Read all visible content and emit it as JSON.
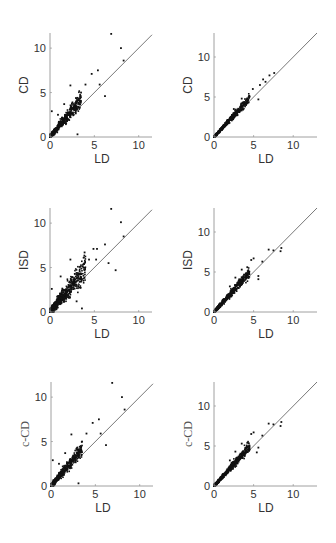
{
  "chart_data": [
    {
      "id": "p11",
      "type": "scatter",
      "row": 0,
      "col": 0,
      "xlabel": "LD",
      "ylabel": "CD",
      "ylabel_style": "sans",
      "xlim": [
        0,
        11.5
      ],
      "ylim": [
        0,
        11.7
      ],
      "xticks": [
        0,
        5,
        10
      ],
      "yticks": [
        0,
        5,
        10
      ],
      "reference_line": "y = x",
      "grid": false,
      "legend": null,
      "cluster": {
        "n": 650,
        "spread": 0.35,
        "bias": 0.2,
        "xmax": 3.5,
        "seed": 11
      },
      "points": [
        [
          6.9,
          11.6
        ],
        [
          8.0,
          10.0
        ],
        [
          8.3,
          8.6
        ],
        [
          6.2,
          4.6
        ],
        [
          5.4,
          7.5
        ],
        [
          4.7,
          7.1
        ],
        [
          2.3,
          5.8
        ],
        [
          3.1,
          0.3
        ],
        [
          0.2,
          2.9
        ],
        [
          4.0,
          5.9
        ],
        [
          5.6,
          5.9
        ],
        [
          3.5,
          5.0
        ],
        [
          0.9,
          2.5
        ],
        [
          1.6,
          3.7
        ]
      ]
    },
    {
      "id": "p12",
      "type": "scatter",
      "row": 0,
      "col": 1,
      "xlabel": "LD",
      "ylabel": "CD",
      "ylabel_style": "sans",
      "xlim": [
        0,
        13
      ],
      "ylim": [
        0,
        13
      ],
      "xticks": [
        0,
        5,
        10
      ],
      "yticks": [
        0,
        5,
        10
      ],
      "reference_line": "y = x",
      "grid": false,
      "legend": null,
      "cluster": {
        "n": 600,
        "spread": 0.18,
        "bias": 0.08,
        "xmax": 4.5,
        "seed": 12
      },
      "points": [
        [
          7.6,
          8.0
        ],
        [
          7.0,
          7.7
        ],
        [
          6.2,
          7.2
        ],
        [
          5.8,
          6.5
        ],
        [
          5.6,
          4.7
        ],
        [
          4.9,
          6.0
        ],
        [
          4.3,
          4.6
        ],
        [
          3.5,
          4.8
        ],
        [
          2.5,
          3.5
        ],
        [
          6.5,
          6.9
        ]
      ]
    },
    {
      "id": "p21",
      "type": "scatter",
      "row": 1,
      "col": 0,
      "xlabel": "LD",
      "ylabel": "ISD",
      "ylabel_style": "sans",
      "xlim": [
        0,
        11.5
      ],
      "ylim": [
        0,
        11.7
      ],
      "xticks": [
        0,
        5,
        10
      ],
      "yticks": [
        0,
        5,
        10
      ],
      "reference_line": "y = x",
      "grid": false,
      "legend": null,
      "cluster": {
        "n": 800,
        "spread": 0.55,
        "bias": 0.25,
        "xmax": 4.0,
        "seed": 21
      },
      "points": [
        [
          6.9,
          11.6
        ],
        [
          8.0,
          10.1
        ],
        [
          8.3,
          8.5
        ],
        [
          7.4,
          4.7
        ],
        [
          6.6,
          5.5
        ],
        [
          6.2,
          7.6
        ],
        [
          5.3,
          7.1
        ],
        [
          4.9,
          7.1
        ],
        [
          3.9,
          6.7
        ],
        [
          2.3,
          5.9
        ],
        [
          3.6,
          0.4
        ],
        [
          4.4,
          5.9
        ],
        [
          5.2,
          5.9
        ],
        [
          0.2,
          2.6
        ],
        [
          1.2,
          4.0
        ],
        [
          3.0,
          1.2
        ]
      ]
    },
    {
      "id": "p22",
      "type": "scatter",
      "row": 1,
      "col": 1,
      "xlabel": "LD",
      "ylabel": "ISD",
      "ylabel_style": "sans",
      "xlim": [
        0,
        13
      ],
      "ylim": [
        0,
        13
      ],
      "xticks": [
        0,
        5,
        10
      ],
      "yticks": [
        0,
        5,
        10
      ],
      "reference_line": "y = x",
      "grid": false,
      "legend": null,
      "cluster": {
        "n": 650,
        "spread": 0.22,
        "bias": 0.1,
        "xmax": 4.5,
        "seed": 22
      },
      "points": [
        [
          8.5,
          8.0
        ],
        [
          8.4,
          7.6
        ],
        [
          7.5,
          7.7
        ],
        [
          6.9,
          7.8
        ],
        [
          6.1,
          6.3
        ],
        [
          5.6,
          4.5
        ],
        [
          5.6,
          4.1
        ],
        [
          5.0,
          6.7
        ],
        [
          4.7,
          6.5
        ],
        [
          4.2,
          5.6
        ],
        [
          3.5,
          5.3
        ],
        [
          2.7,
          4.3
        ],
        [
          2.0,
          3.2
        ]
      ]
    },
    {
      "id": "p31",
      "type": "scatter",
      "row": 2,
      "col": 0,
      "xlabel": "LD",
      "ylabel": "c-CD",
      "ylabel_style": "serif",
      "xlim": [
        0,
        11.5
      ],
      "ylim": [
        0,
        11.7
      ],
      "xticks": [
        0,
        5,
        10
      ],
      "yticks": [
        0,
        5,
        10
      ],
      "reference_line": "y = x",
      "grid": false,
      "legend": null,
      "cluster": {
        "n": 650,
        "spread": 0.35,
        "bias": 0.2,
        "xmax": 3.5,
        "seed": 31
      },
      "points": [
        [
          6.9,
          11.6
        ],
        [
          8.0,
          10.0
        ],
        [
          8.3,
          8.6
        ],
        [
          6.2,
          4.6
        ],
        [
          5.4,
          7.5
        ],
        [
          4.7,
          7.1
        ],
        [
          2.3,
          5.8
        ],
        [
          3.1,
          0.3
        ],
        [
          0.2,
          2.9
        ],
        [
          4.0,
          5.9
        ],
        [
          5.6,
          5.9
        ],
        [
          3.5,
          5.0
        ],
        [
          0.9,
          2.5
        ],
        [
          1.6,
          3.7
        ]
      ]
    },
    {
      "id": "p32",
      "type": "scatter",
      "row": 2,
      "col": 1,
      "xlabel": "LD",
      "ylabel": "c-CD",
      "ylabel_style": "serif",
      "xlim": [
        0,
        13
      ],
      "ylim": [
        0,
        13
      ],
      "xticks": [
        0,
        5,
        10
      ],
      "yticks": [
        0,
        5,
        10
      ],
      "reference_line": "y = x",
      "grid": false,
      "legend": null,
      "cluster": {
        "n": 650,
        "spread": 0.22,
        "bias": 0.1,
        "xmax": 4.5,
        "seed": 32
      },
      "points": [
        [
          8.5,
          8.0
        ],
        [
          8.4,
          7.5
        ],
        [
          7.5,
          7.7
        ],
        [
          6.9,
          7.8
        ],
        [
          6.1,
          6.3
        ],
        [
          5.6,
          4.8
        ],
        [
          5.4,
          4.2
        ],
        [
          5.0,
          6.7
        ],
        [
          4.7,
          6.5
        ],
        [
          4.2,
          5.4
        ],
        [
          3.5,
          5.3
        ],
        [
          2.7,
          4.3
        ],
        [
          2.0,
          3.2
        ]
      ]
    }
  ],
  "layout": {
    "panels": [
      {
        "x0": 50,
        "y0": 137,
        "w": 102,
        "h": 104
      },
      {
        "x0": 214,
        "y0": 137,
        "w": 103,
        "h": 104
      },
      {
        "x0": 50,
        "y0": 312,
        "w": 102,
        "h": 104
      },
      {
        "x0": 214,
        "y0": 312,
        "w": 103,
        "h": 104
      },
      {
        "x0": 51,
        "y0": 486,
        "w": 102,
        "h": 104
      },
      {
        "x0": 214,
        "y0": 486,
        "w": 103,
        "h": 104
      }
    ]
  }
}
